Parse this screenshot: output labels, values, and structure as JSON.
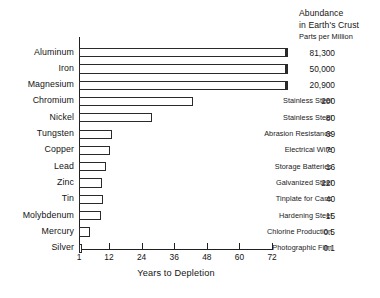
{
  "chart_data": {
    "type": "bar",
    "title": "",
    "xlabel": "Years to Depletion",
    "ylabel": "",
    "xlim": [
      1,
      78
    ],
    "xticks": [
      1,
      12,
      24,
      36,
      48,
      60,
      72
    ],
    "xtick_labels": [
      "1",
      "12",
      "24",
      "36",
      "48",
      "60",
      "72"
    ],
    "grid": false,
    "legend": "none",
    "orientation": "horizontal",
    "categories": [
      "Aluminum",
      "Iron",
      "Magnesium",
      "Chromium",
      "Nickel",
      "Tungsten",
      "Copper",
      "Lead",
      "Zinc",
      "Tin",
      "Molybdenum",
      "Mercury",
      "Silver"
    ],
    "values": [
      78,
      78,
      78,
      43,
      28,
      13,
      12.5,
      11,
      9.5,
      10,
      9,
      5,
      1.5
    ],
    "value_note": "Bars for Aluminum, Iron and Magnesium run past the 72-year tick and are capped (off-scale).",
    "annotations": [
      "",
      "",
      "",
      "Stainless Steel",
      "Stainless Steel",
      "Abrasion Resistance",
      "Electrical Wire",
      "Storage Batteries",
      "Galvanized Steel",
      "Tinplate for Cans",
      "Hardening Steel",
      "Chlorine Production",
      "Photographic Film"
    ],
    "abundance_ppm": [
      "81,300",
      "50,000",
      "20,900",
      "200",
      "80",
      "69",
      "70",
      "16",
      "220",
      "40",
      "15",
      "0.5",
      "0.1"
    ]
  },
  "header": {
    "line1": "Abundance",
    "line2": "in Earth's Crust",
    "line3": "Parts per Million"
  },
  "colors": {
    "ink": "#1a1a1a",
    "axis": "#202020",
    "bar_fill": "#ffffff",
    "bar_stroke": "#2a2a2a",
    "background": "#ffffff"
  }
}
